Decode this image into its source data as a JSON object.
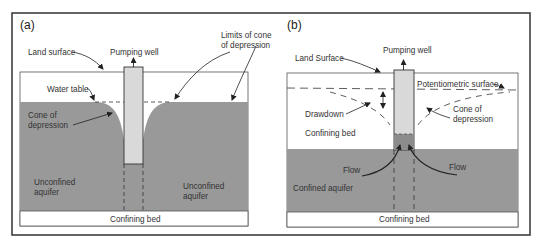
{
  "colors": {
    "frame": "#333333",
    "aquifer": "#999999",
    "well": "#d9d9d9",
    "well_water": "#8c8c8c",
    "background": "#ffffff",
    "text": "#333333"
  },
  "panel_a": {
    "label": "(a)",
    "labels": {
      "land_surface": "Land surface",
      "pumping_well": "Pumping well",
      "limits_line1": "Limits of cone",
      "limits_line2": "of depression",
      "water_table": "Water table",
      "cone_line1": "Cone of",
      "cone_line2": "depression",
      "unconfined_left_line1": "Unconfined",
      "unconfined_left_line2": "aquifer",
      "unconfined_right_line1": "Unconfined",
      "unconfined_right_line2": "aquifer",
      "confining_bed": "Confining bed"
    }
  },
  "panel_b": {
    "label": "(b)",
    "labels": {
      "land_surface": "Land Surface",
      "pumping_well": "Pumping well",
      "potentiometric": "Potentiometric surface",
      "drawdown": "Drawdown",
      "cone_line1": "Cone of",
      "cone_line2": "depression",
      "confining_bed_top": "Confining bed",
      "flow_left": "Flow",
      "flow_right": "Flow",
      "confined_aquifer": "Confined aquifer",
      "confining_bed_bottom": "Confining bed"
    }
  }
}
